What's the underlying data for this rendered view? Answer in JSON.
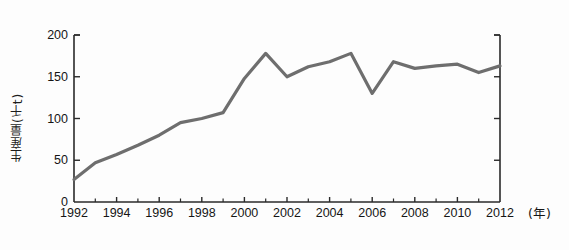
{
  "chart_data": {
    "type": "line",
    "title": "",
    "subtitle": "",
    "xlabel": "(年)",
    "ylabel": "生産量(千t)",
    "x": [
      1992,
      1993,
      1994,
      1995,
      1996,
      1997,
      1998,
      1999,
      2000,
      2001,
      2002,
      2003,
      2004,
      2005,
      2006,
      2007,
      2008,
      2009,
      2010,
      2011,
      2012
    ],
    "values": [
      27,
      47,
      57,
      68,
      80,
      95,
      100,
      107,
      148,
      178,
      150,
      162,
      168,
      178,
      130,
      168,
      160,
      163,
      165,
      155,
      163
    ],
    "series": [
      {
        "name": "生産量",
        "color": "#6e6e6e",
        "values": [
          27,
          47,
          57,
          68,
          80,
          95,
          100,
          107,
          148,
          178,
          150,
          162,
          168,
          178,
          130,
          168,
          160,
          163,
          165,
          155,
          163
        ]
      }
    ],
    "xlim": [
      1992,
      2012
    ],
    "ylim": [
      0,
      200
    ],
    "ytick_values": [
      0,
      50,
      100,
      150,
      200
    ],
    "ytick_labels": [
      "0",
      "50",
      "100",
      "150",
      "200"
    ],
    "xtick_values": [
      1992,
      1994,
      1996,
      1998,
      2000,
      2002,
      2004,
      2006,
      2008,
      2010,
      2012
    ],
    "xtick_labels": [
      "1992",
      "1994",
      "1996",
      "1998",
      "2000",
      "2002",
      "2004",
      "2006",
      "2008",
      "2010",
      "2012"
    ],
    "x_minor_tick_values": [
      1993,
      1995,
      1997,
      1999,
      2001,
      2003,
      2005,
      2007,
      2009,
      2011
    ],
    "grid": false,
    "legend": false,
    "legend_position": "none",
    "axis_style": "left-and-right-spines",
    "line_color": "#6e6e6e",
    "line_width": 3.2,
    "axis_color": "#2a2a2a",
    "background_color": "#fdfdfd"
  },
  "axes": {
    "y_title": "生産量(千t)",
    "x_unit": "(年)"
  }
}
